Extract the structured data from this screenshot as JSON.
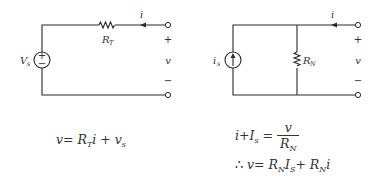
{
  "diagram": {
    "thevenin": {
      "source_label": "V",
      "source_sub": "s",
      "source_plus": "+",
      "source_minus": "−",
      "resistor_label": "R",
      "resistor_sub": "T",
      "current_label": "i",
      "terminal_plus": "+",
      "terminal_voltage": "v",
      "terminal_minus": "−",
      "equation": {
        "lhs": "v",
        "eq": "=",
        "r": "R",
        "r_sub": "T",
        "i": "i",
        "plus": "+",
        "v": "v",
        "v_sub": "s"
      }
    },
    "norton": {
      "source_label": "i",
      "source_sub": "s",
      "resistor_label": "R",
      "resistor_sub": "N",
      "current_label": "i",
      "terminal_plus": "+",
      "terminal_voltage": "v",
      "terminal_minus": "−",
      "equation1": {
        "i": "i",
        "plus": "+",
        "I": "I",
        "I_sub": "s",
        "eq": "=",
        "num": "v",
        "den": "R",
        "den_sub": "N"
      },
      "equation2": {
        "therefore": "∴",
        "v": "v",
        "eq": "=",
        "r1": "R",
        "r1_sub": "N",
        "I": "I",
        "I_sub": "S",
        "plus": "+",
        "r2": "R",
        "r2_sub": "N",
        "i": "i"
      }
    }
  }
}
